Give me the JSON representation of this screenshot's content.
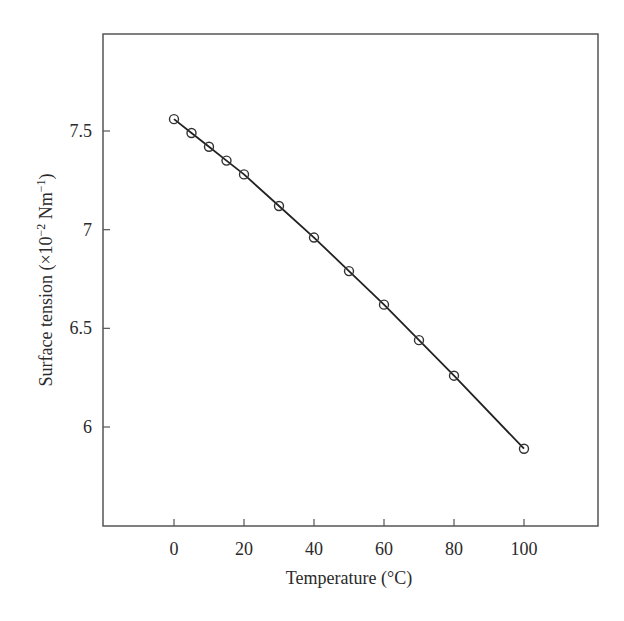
{
  "chart_data": {
    "type": "line",
    "title": "",
    "xlabel": "Temperature (°C)",
    "ylabel": "Surface tension (×10⁻² Nm⁻¹)",
    "ylabel_parts": {
      "main": "Surface tension (×10",
      "exp1": "−2",
      "mid": " Nm",
      "exp2": "−1",
      "end": ")"
    },
    "xlim": [
      -20,
      120
    ],
    "ylim": [
      5.5,
      8.0
    ],
    "xticks": [
      0,
      20,
      40,
      60,
      80,
      100
    ],
    "xtick_labels": [
      "0",
      "20",
      "40",
      "60",
      "80",
      "100"
    ],
    "yticks": [
      6,
      6.5,
      7,
      7.5
    ],
    "ytick_labels": [
      "6",
      "6.5",
      "7",
      "7.5"
    ],
    "grid": false,
    "legend": null,
    "marker": "open-circle",
    "line_color": "#222222",
    "series": [
      {
        "name": "Surface tension of water",
        "x": [
          0,
          5,
          10,
          15,
          20,
          30,
          40,
          50,
          60,
          70,
          80,
          100
        ],
        "values": [
          7.56,
          7.49,
          7.42,
          7.35,
          7.28,
          7.12,
          6.96,
          6.79,
          6.62,
          6.44,
          6.26,
          5.89
        ]
      }
    ]
  }
}
